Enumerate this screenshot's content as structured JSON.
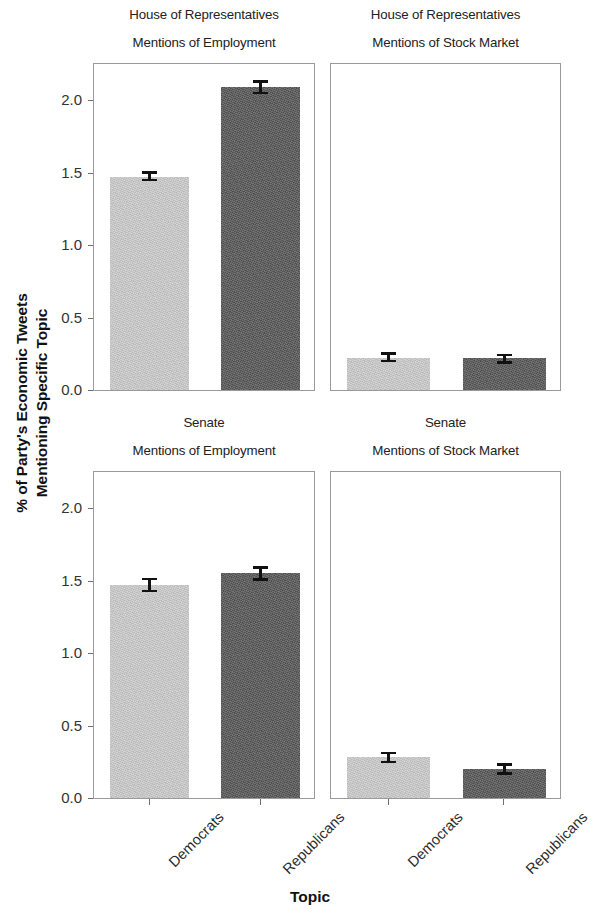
{
  "chart_data": {
    "type": "bar",
    "title": "",
    "xlabel": "Topic",
    "ylabel_line1": "% of Party's Economic Tweets",
    "ylabel_line2": "Mentioning Specific Topic",
    "ylim": [
      0.0,
      2.25
    ],
    "yticks": [
      "0.0",
      "0.5",
      "1.0",
      "1.5",
      "2.0"
    ],
    "ytick_values": [
      0.0,
      0.5,
      1.0,
      1.5,
      2.0
    ],
    "grid": false,
    "legend": "none",
    "categories": [
      "Democrats",
      "Republicans"
    ],
    "facet_rows": [
      "House of Representatives",
      "Senate"
    ],
    "facet_cols": [
      "Mentions of Employment",
      "Mentions of Stock Market"
    ],
    "colors": {
      "Democrats": "#cbcbcb",
      "Republicans": "#565656",
      "panel_border": "#9a9a9a",
      "error_bar": "#111111"
    },
    "panels": [
      {
        "row_label": "House of Representatives",
        "col_label": "Mentions of Employment",
        "bars": [
          {
            "category": "Democrats",
            "value": 1.47,
            "err_low": 1.44,
            "err_high": 1.51
          },
          {
            "category": "Republicans",
            "value": 2.09,
            "err_low": 2.04,
            "err_high": 2.14
          }
        ]
      },
      {
        "row_label": "House of Representatives",
        "col_label": "Mentions of Stock Market",
        "bars": [
          {
            "category": "Democrats",
            "value": 0.22,
            "err_low": 0.19,
            "err_high": 0.26
          },
          {
            "category": "Republicans",
            "value": 0.22,
            "err_low": 0.18,
            "err_high": 0.25
          }
        ]
      },
      {
        "row_label": "Senate",
        "col_label": "Mentions of Employment",
        "bars": [
          {
            "category": "Democrats",
            "value": 1.47,
            "err_low": 1.42,
            "err_high": 1.52
          },
          {
            "category": "Republicans",
            "value": 1.55,
            "err_low": 1.5,
            "err_high": 1.6
          }
        ]
      },
      {
        "row_label": "Senate",
        "col_label": "Mentions of Stock Market",
        "bars": [
          {
            "category": "Democrats",
            "value": 0.28,
            "err_low": 0.24,
            "err_high": 0.32
          },
          {
            "category": "Republicans",
            "value": 0.2,
            "err_low": 0.16,
            "err_high": 0.24
          }
        ]
      }
    ]
  }
}
